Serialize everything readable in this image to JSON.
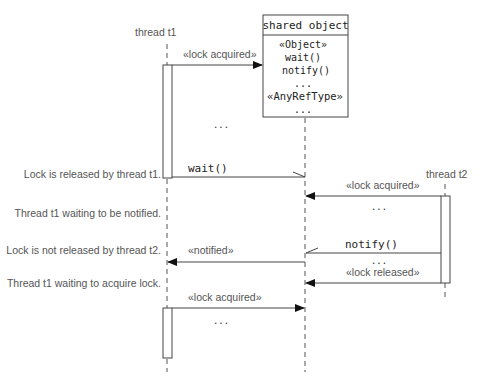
{
  "diagram": {
    "type": "uml-sequence",
    "lifelines": [
      {
        "id": "t1",
        "label": "thread t1"
      },
      {
        "id": "shared",
        "label": "shared object",
        "members": [
          "«Object»",
          "wait()",
          "notify()",
          "...",
          "«AnyRefType»",
          "..."
        ]
      },
      {
        "id": "t2",
        "label": "thread t2"
      }
    ],
    "messages": [
      {
        "label": "«lock acquired»",
        "from": "t1",
        "to": "shared"
      },
      {
        "label": "...",
        "note": "ellipsis"
      },
      {
        "label": "wait()",
        "from": "t1",
        "to": "shared"
      },
      {
        "label": "«lock acquired»",
        "from": "t2",
        "to": "shared"
      },
      {
        "label": "...",
        "note": "ellipsis"
      },
      {
        "label": "«notified»",
        "from": "shared",
        "to": "t1"
      },
      {
        "label": "notify()",
        "from": "t2",
        "to": "shared"
      },
      {
        "label": "...",
        "note": "ellipsis"
      },
      {
        "label": "«lock released»",
        "from": "t2",
        "to": "shared"
      },
      {
        "label": "«lock acquired»",
        "from": "t1",
        "to": "shared"
      },
      {
        "label": "...",
        "note": "ellipsis"
      }
    ],
    "annotations": [
      "Lock is released by thread t1.",
      "Thread t1 waiting to be notified.",
      "Lock is not released by thread t2.",
      "Thread t1 waiting to acquire lock."
    ]
  }
}
